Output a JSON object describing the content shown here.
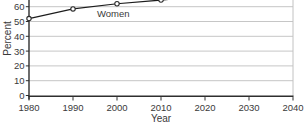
{
  "chart_data": {
    "type": "line",
    "title": "",
    "xlabel": "Year",
    "ylabel": "Percent",
    "x_ticks": [
      1980,
      1990,
      2000,
      2010,
      2020,
      2030,
      2040
    ],
    "y_ticks": [
      0,
      10,
      20,
      30,
      40,
      50,
      60
    ],
    "xlim": [
      1980,
      2040
    ],
    "ylim_visible": [
      0,
      65
    ],
    "grid": "horizontal-only",
    "legend": "inline-series-label",
    "cropped_at_top": true,
    "series": [
      {
        "name": "Women",
        "marker": "open-circle",
        "x": [
          1980,
          1990,
          2000,
          2010
        ],
        "values": [
          52,
          58.5,
          62,
          64.5
        ],
        "projected_beyond_last_point": true
      }
    ]
  },
  "colors": {
    "background": "#ffffff",
    "grid": "#c6c6c6",
    "right_border": "#c2c2c2",
    "axis": "#2e2e2e",
    "line": "#1c1c1c",
    "marker_fill": "#ffffff",
    "marker_stroke": "#2b2b2b",
    "text": "#3a3a3a"
  }
}
